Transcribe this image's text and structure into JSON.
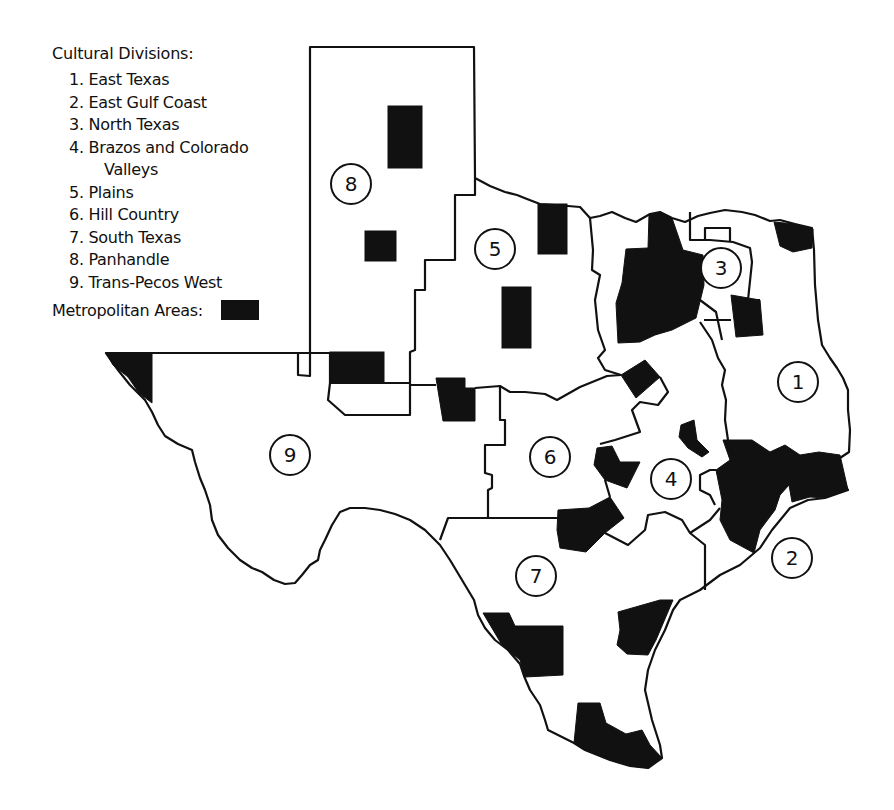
{
  "legend": {
    "title": "Cultural Divisions:",
    "divisions": [
      {
        "num": "1.",
        "name": "East Texas"
      },
      {
        "num": "2.",
        "name": "East Gulf Coast"
      },
      {
        "num": "3.",
        "name": "North Texas"
      },
      {
        "num": "4.",
        "name": "Brazos and Colorado",
        "cont": "Valleys"
      },
      {
        "num": "5.",
        "name": "Plains"
      },
      {
        "num": "6.",
        "name": "Hill Country"
      },
      {
        "num": "7.",
        "name": "South Texas"
      },
      {
        "num": "8.",
        "name": "Panhandle"
      },
      {
        "num": "9.",
        "name": "Trans-Pecos West"
      }
    ],
    "metro_label": "Metropolitan Areas:",
    "metro_color": "#111111"
  },
  "map": {
    "region_labels": [
      {
        "id": "1",
        "x": 798,
        "y": 382
      },
      {
        "id": "2",
        "x": 792,
        "y": 558
      },
      {
        "id": "3",
        "x": 721,
        "y": 268
      },
      {
        "id": "4",
        "x": 671,
        "y": 479
      },
      {
        "id": "5",
        "x": 495,
        "y": 249
      },
      {
        "id": "6",
        "x": 550,
        "y": 457
      },
      {
        "id": "7",
        "x": 536,
        "y": 576
      },
      {
        "id": "8",
        "x": 351,
        "y": 184
      },
      {
        "id": "9",
        "x": 290,
        "y": 455
      }
    ],
    "line_color": "#111111",
    "background": "#ffffff"
  }
}
